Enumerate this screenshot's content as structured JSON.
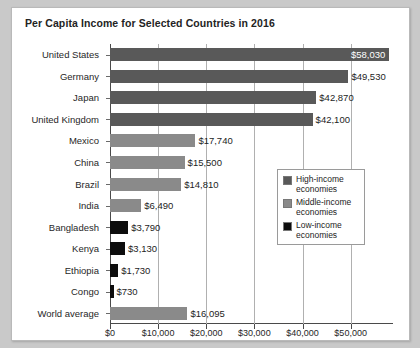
{
  "chart_data": {
    "type": "bar",
    "orientation": "horizontal",
    "title": "Per Capita Income for Selected Countries in 2016",
    "xlabel": "",
    "ylabel": "",
    "xlim": [
      0,
      58800
    ],
    "grid": true,
    "legend_position": "inside-right",
    "xticks": [
      {
        "value": 0,
        "label": "$0"
      },
      {
        "value": 10000,
        "label": "$10,000"
      },
      {
        "value": 20000,
        "label": "$20,000"
      },
      {
        "value": 30000,
        "label": "$30,000"
      },
      {
        "value": 40000,
        "label": "$40,000"
      },
      {
        "value": 50000,
        "label": "$50,000"
      }
    ],
    "categories": [
      "United States",
      "Germany",
      "Japan",
      "United Kingdom",
      "Mexico",
      "China",
      "Brazil",
      "India",
      "Bangladesh",
      "Kenya",
      "Ethiopia",
      "Congo",
      "World average"
    ],
    "values": [
      58030,
      49530,
      42870,
      42100,
      17740,
      15500,
      14810,
      6490,
      3790,
      3130,
      1730,
      730,
      16095
    ],
    "value_labels": [
      "$58,030",
      "$49,530",
      "$42,870",
      "$42,100",
      "$17,740",
      "$15,500",
      "$14,810",
      "$6,490",
      "$3,790",
      "$3,130",
      "$1,730",
      "$730",
      "$16,095"
    ],
    "groups": [
      "high",
      "high",
      "high",
      "high",
      "middle",
      "middle",
      "middle",
      "middle",
      "low",
      "low",
      "low",
      "low",
      "middle"
    ],
    "label_placement": [
      "inside",
      "outside",
      "outside",
      "outside",
      "outside",
      "outside",
      "outside",
      "outside",
      "outside",
      "outside",
      "outside",
      "outside",
      "outside"
    ],
    "colors": {
      "high": "#595959",
      "middle": "#8a8a8a",
      "low": "#0d0d0d"
    }
  },
  "legend": {
    "items": [
      {
        "key": "high",
        "label": "High-income economies"
      },
      {
        "key": "middle",
        "label": "Middle-income economies"
      },
      {
        "key": "low",
        "label": "Low-income economies"
      }
    ]
  }
}
